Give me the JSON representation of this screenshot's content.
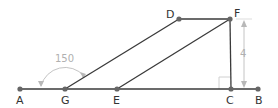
{
  "colors": {
    "line": "#3a3a3a",
    "point": "#666666",
    "annotation": "#b5b5b5",
    "label": "#333333"
  },
  "points": [
    {
      "id": "A",
      "label": "A",
      "x": 20,
      "y": 89,
      "lx": 16,
      "ly": 104
    },
    {
      "id": "G",
      "label": "G",
      "x": 65,
      "y": 89,
      "lx": 61,
      "ly": 104
    },
    {
      "id": "E",
      "label": "E",
      "x": 117,
      "y": 89,
      "lx": 113,
      "ly": 104
    },
    {
      "id": "C",
      "label": "C",
      "x": 231,
      "y": 89,
      "lx": 226,
      "ly": 104
    },
    {
      "id": "B",
      "label": "B",
      "x": 258,
      "y": 89,
      "lx": 255,
      "ly": 104
    },
    {
      "id": "D",
      "label": "D",
      "x": 179,
      "y": 19,
      "lx": 166,
      "ly": 18
    },
    {
      "id": "F",
      "label": "F",
      "x": 230,
      "y": 19,
      "lx": 234,
      "ly": 17
    }
  ],
  "segments": [
    {
      "from": "A",
      "to": "B"
    },
    {
      "from": "G",
      "to": "D"
    },
    {
      "from": "E",
      "to": "F"
    },
    {
      "from": "D",
      "to": "F"
    },
    {
      "from": "F",
      "to": "C"
    }
  ],
  "annotations": {
    "angle": {
      "vertex": "G",
      "value": "150",
      "text_x": 55,
      "text_y": 62
    },
    "length": {
      "between": [
        "F",
        "C"
      ],
      "value": "4",
      "text_x": 240,
      "text_y": 56
    },
    "right_angle": {
      "vertex": "C"
    }
  }
}
